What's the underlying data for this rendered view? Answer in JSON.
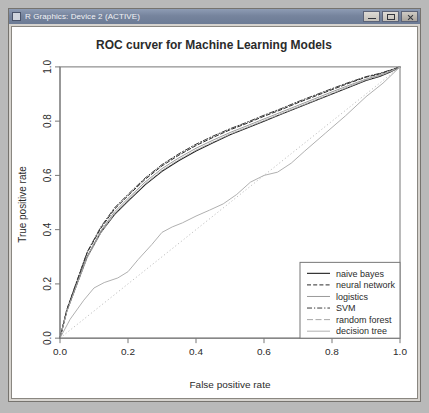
{
  "window": {
    "title": "R Graphics: Device 2 (ACTIVE)",
    "icon": "r-graphics-icon",
    "controls": {
      "minimize": "minimize-icon",
      "maximize": "maximize-icon",
      "close": "close-icon"
    }
  },
  "chart_data": {
    "type": "line",
    "title": "ROC curver for Machine Learning Models",
    "xlabel": "False positive rate",
    "ylabel": "True positive rate",
    "xlim": [
      0,
      1
    ],
    "ylim": [
      0,
      1
    ],
    "xticks": [
      "0.0",
      "0.2",
      "0.4",
      "0.6",
      "0.8",
      "1.0"
    ],
    "xtick_values": [
      0,
      0.2,
      0.4,
      0.6,
      0.8,
      1
    ],
    "yticks": [
      "0.0",
      "0.2",
      "0.4",
      "0.6",
      "0.8",
      "1.0"
    ],
    "ytick_values": [
      0,
      0.2,
      0.4,
      0.6,
      0.8,
      1
    ],
    "grid": false,
    "legend_position": "bottom-right",
    "reference_line": {
      "name": "chance diagonal",
      "style": "dotted",
      "color": "#b9b9b9",
      "x": [
        0,
        1
      ],
      "y": [
        0,
        1
      ]
    },
    "series": [
      {
        "name": "naive bayes",
        "style": "solid",
        "color": "#1c1c1c",
        "width": 1.1,
        "x": [
          0,
          0.02,
          0.05,
          0.08,
          0.12,
          0.16,
          0.2,
          0.25,
          0.3,
          0.35,
          0.4,
          0.45,
          0.5,
          0.55,
          0.6,
          0.65,
          0.7,
          0.75,
          0.8,
          0.85,
          0.9,
          0.94,
          0.97,
          1
        ],
        "y": [
          0,
          0.1,
          0.2,
          0.3,
          0.39,
          0.455,
          0.505,
          0.565,
          0.615,
          0.655,
          0.69,
          0.72,
          0.75,
          0.775,
          0.8,
          0.825,
          0.85,
          0.875,
          0.9,
          0.925,
          0.95,
          0.965,
          0.98,
          1
        ]
      },
      {
        "name": "neural network",
        "style": "dashed",
        "color": "#2a2a2a",
        "width": 1.0,
        "x": [
          0,
          0.02,
          0.05,
          0.08,
          0.12,
          0.16,
          0.2,
          0.25,
          0.3,
          0.35,
          0.4,
          0.45,
          0.5,
          0.55,
          0.6,
          0.65,
          0.7,
          0.75,
          0.8,
          0.85,
          0.9,
          0.94,
          0.97,
          1
        ],
        "y": [
          0,
          0.105,
          0.21,
          0.315,
          0.405,
          0.475,
          0.525,
          0.585,
          0.635,
          0.675,
          0.71,
          0.74,
          0.768,
          0.792,
          0.818,
          0.842,
          0.868,
          0.892,
          0.916,
          0.94,
          0.962,
          0.974,
          0.986,
          1
        ]
      },
      {
        "name": "logistics",
        "style": "faint-solid",
        "color": "#9a9a9a",
        "width": 1.0,
        "x": [
          0,
          0.02,
          0.05,
          0.08,
          0.12,
          0.16,
          0.2,
          0.25,
          0.3,
          0.35,
          0.4,
          0.45,
          0.5,
          0.55,
          0.6,
          0.65,
          0.7,
          0.75,
          0.8,
          0.85,
          0.9,
          0.94,
          0.97,
          1
        ],
        "y": [
          0,
          0.1,
          0.2,
          0.3,
          0.395,
          0.465,
          0.515,
          0.575,
          0.625,
          0.665,
          0.7,
          0.73,
          0.758,
          0.783,
          0.808,
          0.833,
          0.858,
          0.883,
          0.908,
          0.932,
          0.955,
          0.97,
          0.983,
          1
        ]
      },
      {
        "name": "SVM",
        "style": "dashdot",
        "color": "#3a3a3a",
        "width": 1.0,
        "x": [
          0,
          0.02,
          0.05,
          0.08,
          0.12,
          0.16,
          0.2,
          0.25,
          0.3,
          0.35,
          0.4,
          0.45,
          0.5,
          0.55,
          0.6,
          0.65,
          0.7,
          0.75,
          0.8,
          0.85,
          0.9,
          0.94,
          0.97,
          1
        ],
        "y": [
          0,
          0.105,
          0.212,
          0.318,
          0.41,
          0.48,
          0.53,
          0.59,
          0.64,
          0.68,
          0.715,
          0.745,
          0.772,
          0.796,
          0.822,
          0.846,
          0.872,
          0.896,
          0.92,
          0.943,
          0.964,
          0.976,
          0.988,
          1
        ]
      },
      {
        "name": "random forest",
        "style": "faint-dash",
        "color": "#a8a8a8",
        "width": 1.0,
        "x": [
          0,
          0.02,
          0.05,
          0.08,
          0.12,
          0.16,
          0.2,
          0.25,
          0.3,
          0.35,
          0.4,
          0.45,
          0.5,
          0.55,
          0.6,
          0.65,
          0.7,
          0.75,
          0.8,
          0.85,
          0.9,
          0.94,
          0.97,
          1
        ],
        "y": [
          0,
          0.098,
          0.198,
          0.296,
          0.388,
          0.458,
          0.508,
          0.568,
          0.618,
          0.658,
          0.693,
          0.723,
          0.752,
          0.777,
          0.802,
          0.827,
          0.852,
          0.877,
          0.902,
          0.927,
          0.952,
          0.967,
          0.982,
          1
        ]
      },
      {
        "name": "decision tree",
        "style": "solid-light",
        "color": "#b0b0b0",
        "width": 1.0,
        "x": [
          0,
          0.03,
          0.07,
          0.1,
          0.13,
          0.17,
          0.2,
          0.23,
          0.27,
          0.3,
          0.33,
          0.36,
          0.4,
          0.44,
          0.48,
          0.52,
          0.56,
          0.6,
          0.64,
          0.68,
          0.72,
          0.78,
          0.84,
          0.9,
          0.95,
          1
        ],
        "y": [
          0,
          0.07,
          0.14,
          0.185,
          0.205,
          0.222,
          0.245,
          0.29,
          0.345,
          0.39,
          0.41,
          0.425,
          0.45,
          0.472,
          0.495,
          0.53,
          0.575,
          0.6,
          0.612,
          0.645,
          0.69,
          0.755,
          0.82,
          0.89,
          0.94,
          1
        ]
      }
    ]
  }
}
